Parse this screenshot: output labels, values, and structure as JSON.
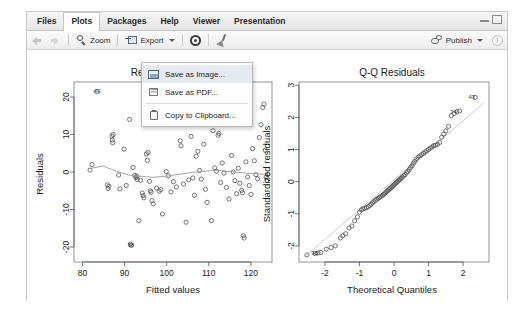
{
  "window": {
    "controls": [
      {
        "name": "minimize",
        "glyph": "—"
      },
      {
        "name": "maximize",
        "glyph": "□"
      }
    ]
  },
  "tabs": [
    {
      "label": "Files",
      "active": false
    },
    {
      "label": "Plots",
      "active": true
    },
    {
      "label": "Packages",
      "active": false
    },
    {
      "label": "Help",
      "active": false
    },
    {
      "label": "Viewer",
      "active": false
    },
    {
      "label": "Presentation",
      "active": false
    }
  ],
  "toolbar": {
    "back_icon": "back-arrow-icon",
    "forward_icon": "forward-arrow-icon",
    "zoom_label": "Zoom",
    "zoom_icon": "magnifier-icon",
    "export_label": "Export",
    "export_icon": "export-icon",
    "export_caret": "chevron-down-icon",
    "settings_icon": "gear-icon",
    "clear_icon": "broom-icon",
    "publish_label": "Publish",
    "publish_icon": "publish-icon",
    "publish_caret": "chevron-down-icon",
    "refresh_icon": "refresh-icon"
  },
  "export_menu": {
    "visible": true,
    "items": [
      {
        "label": "Save as Image...",
        "icon": "image-icon",
        "highlighted": true
      },
      {
        "label": "Save as PDF...",
        "icon": "pdf-icon",
        "highlighted": false
      },
      {
        "label": "Copy to Clipboard...",
        "icon": "clipboard-icon",
        "highlighted": false
      }
    ]
  },
  "colors": {
    "accent": "#e4eaf0",
    "panel_bg": "#f0f0f0",
    "plot_bg": "#ffffff",
    "point_stroke": "#4a4a4a",
    "line": "#9a9a9a"
  },
  "chart_data": [
    {
      "type": "scatter",
      "name": "residuals-vs-fitted",
      "title": "Residuals vs Fitted",
      "title_occluded": true,
      "xlabel": "Fitted values",
      "ylabel": "Residuals",
      "xlim": [
        78,
        125
      ],
      "ylim": [
        -24,
        24
      ],
      "xticks": [
        80,
        90,
        100,
        110,
        120
      ],
      "yticks": [
        -20,
        -10,
        0,
        10,
        20
      ],
      "grid": false,
      "legend": "none",
      "annotations": [
        {
          "label": "43",
          "x": 83.5,
          "y": 21.5
        },
        {
          "label": "74",
          "x": 110.0,
          "y": 17.3
        },
        {
          "label": "98",
          "x": 91.5,
          "y": -19.5
        }
      ],
      "smooth_line": {
        "name": "loess",
        "x": [
          81.5,
          85,
          88,
          91,
          94,
          97,
          100,
          103,
          106,
          109,
          112,
          115,
          118,
          121,
          124
        ],
        "y": [
          0.9,
          1.6,
          0.2,
          -0.8,
          -1.2,
          -1.4,
          -1.1,
          -0.6,
          -0.1,
          0.2,
          0.5,
          0.1,
          -0.2,
          -0.5,
          -0.6
        ]
      },
      "points": [
        {
          "x": 81.8,
          "y": 0.5
        },
        {
          "x": 82.3,
          "y": 2.0
        },
        {
          "x": 83.4,
          "y": 21.4
        },
        {
          "x": 85.9,
          "y": -3.4
        },
        {
          "x": 86.1,
          "y": -4.4
        },
        {
          "x": 86.3,
          "y": -3.8
        },
        {
          "x": 87.0,
          "y": 9.6
        },
        {
          "x": 87.1,
          "y": 8.5
        },
        {
          "x": 87.2,
          "y": 7.8
        },
        {
          "x": 87.3,
          "y": 10.0
        },
        {
          "x": 88.6,
          "y": -0.8
        },
        {
          "x": 88.9,
          "y": -4.5
        },
        {
          "x": 89.9,
          "y": 6.1
        },
        {
          "x": 90.4,
          "y": -3.6
        },
        {
          "x": 91.2,
          "y": 14.0
        },
        {
          "x": 91.4,
          "y": -19.2
        },
        {
          "x": 91.6,
          "y": -19.6
        },
        {
          "x": 92.0,
          "y": 1.2
        },
        {
          "x": 92.4,
          "y": -0.9
        },
        {
          "x": 92.7,
          "y": -1.5
        },
        {
          "x": 92.9,
          "y": -1.1
        },
        {
          "x": 93.0,
          "y": -2.0
        },
        {
          "x": 93.4,
          "y": -13.0
        },
        {
          "x": 93.8,
          "y": -2.2
        },
        {
          "x": 94.2,
          "y": -5.6
        },
        {
          "x": 94.4,
          "y": -6.3
        },
        {
          "x": 94.6,
          "y": -6.9
        },
        {
          "x": 95.2,
          "y": 4.8
        },
        {
          "x": 95.4,
          "y": 3.1
        },
        {
          "x": 95.6,
          "y": 5.2
        },
        {
          "x": 95.9,
          "y": -2.5
        },
        {
          "x": 96.1,
          "y": -5.0
        },
        {
          "x": 96.3,
          "y": -5.4
        },
        {
          "x": 96.5,
          "y": -7.6
        },
        {
          "x": 96.8,
          "y": -8.5
        },
        {
          "x": 97.6,
          "y": -4.3
        },
        {
          "x": 98.2,
          "y": -5.1
        },
        {
          "x": 98.6,
          "y": -4.7
        },
        {
          "x": 99.0,
          "y": -11.2
        },
        {
          "x": 99.6,
          "y": 17.0
        },
        {
          "x": 99.9,
          "y": 0.1
        },
        {
          "x": 100.4,
          "y": -1.0
        },
        {
          "x": 101.0,
          "y": -5.3
        },
        {
          "x": 101.6,
          "y": -2.6
        },
        {
          "x": 102.3,
          "y": -4.0
        },
        {
          "x": 103.2,
          "y": 8.3
        },
        {
          "x": 103.4,
          "y": 7.0
        },
        {
          "x": 104.0,
          "y": -3.2
        },
        {
          "x": 104.6,
          "y": -13.4
        },
        {
          "x": 105.2,
          "y": -2.1
        },
        {
          "x": 105.8,
          "y": 9.5
        },
        {
          "x": 106.2,
          "y": -1.6
        },
        {
          "x": 106.6,
          "y": -6.2
        },
        {
          "x": 107.0,
          "y": 4.2
        },
        {
          "x": 107.4,
          "y": 5.5
        },
        {
          "x": 107.8,
          "y": 0.4
        },
        {
          "x": 108.2,
          "y": -1.9
        },
        {
          "x": 108.8,
          "y": 7.4
        },
        {
          "x": 109.2,
          "y": -4.6
        },
        {
          "x": 109.6,
          "y": -8.1
        },
        {
          "x": 110.2,
          "y": 17.2
        },
        {
          "x": 110.6,
          "y": -13.0
        },
        {
          "x": 111.0,
          "y": 11.0
        },
        {
          "x": 111.4,
          "y": 1.1
        },
        {
          "x": 111.8,
          "y": 0.2
        },
        {
          "x": 112.2,
          "y": 9.8
        },
        {
          "x": 112.4,
          "y": 10.3
        },
        {
          "x": 112.8,
          "y": -2.8
        },
        {
          "x": 113.2,
          "y": 2.4
        },
        {
          "x": 113.6,
          "y": -0.3
        },
        {
          "x": 114.2,
          "y": -4.1
        },
        {
          "x": 114.8,
          "y": -7.2
        },
        {
          "x": 115.4,
          "y": 4.4
        },
        {
          "x": 115.8,
          "y": 0.0
        },
        {
          "x": 116.2,
          "y": -2.3
        },
        {
          "x": 116.6,
          "y": -5.8
        },
        {
          "x": 117.0,
          "y": 1.0
        },
        {
          "x": 117.4,
          "y": -3.0
        },
        {
          "x": 117.8,
          "y": -4.9
        },
        {
          "x": 118.0,
          "y": -5.5
        },
        {
          "x": 118.2,
          "y": -17.0
        },
        {
          "x": 118.4,
          "y": -17.6
        },
        {
          "x": 118.8,
          "y": 2.7
        },
        {
          "x": 119.2,
          "y": -1.3
        },
        {
          "x": 119.6,
          "y": -3.6
        },
        {
          "x": 120.0,
          "y": -6.0
        },
        {
          "x": 120.4,
          "y": 6.2
        },
        {
          "x": 120.8,
          "y": 3.0
        },
        {
          "x": 121.2,
          "y": -0.7
        },
        {
          "x": 121.6,
          "y": -1.8
        },
        {
          "x": 122.0,
          "y": 9.2
        },
        {
          "x": 122.4,
          "y": 12.6
        },
        {
          "x": 122.8,
          "y": 17.2
        },
        {
          "x": 123.1,
          "y": 18.1
        },
        {
          "x": 123.4,
          "y": 5.8
        },
        {
          "x": 123.6,
          "y": -1.4
        },
        {
          "x": 123.8,
          "y": -2.2
        },
        {
          "x": 124.0,
          "y": -0.6
        }
      ]
    },
    {
      "type": "scatter",
      "name": "qq-residuals",
      "title": "Q-Q Residuals",
      "xlabel": "Theoretical Quantiles",
      "ylabel": "Standardized residuals",
      "xlim": [
        -2.75,
        2.75
      ],
      "ylim": [
        -2.5,
        3.1
      ],
      "xticks": [
        -2,
        -1,
        0,
        1,
        2
      ],
      "yticks": [
        -2,
        -1,
        0,
        1,
        2,
        3
      ],
      "grid": false,
      "legend": "none",
      "reference_line": {
        "x0": -2.6,
        "y0": -2.35,
        "x1": 2.6,
        "y1": 2.45
      },
      "annotations": [
        {
          "label": "43",
          "x": 2.25,
          "y": 2.62
        },
        {
          "label": "74",
          "x": 1.72,
          "y": 2.18
        },
        {
          "label": "98",
          "x": -2.3,
          "y": -2.22
        }
      ],
      "points": [
        {
          "x": -2.52,
          "y": -2.28
        },
        {
          "x": -2.28,
          "y": -2.24
        },
        {
          "x": -2.2,
          "y": -2.22
        },
        {
          "x": -2.12,
          "y": -2.2
        },
        {
          "x": -1.96,
          "y": -2.1
        },
        {
          "x": -1.82,
          "y": -2.05
        },
        {
          "x": -1.7,
          "y": -2.0
        },
        {
          "x": -1.55,
          "y": -1.75
        },
        {
          "x": -1.48,
          "y": -1.68
        },
        {
          "x": -1.4,
          "y": -1.62
        },
        {
          "x": -1.3,
          "y": -1.44
        },
        {
          "x": -1.22,
          "y": -1.38
        },
        {
          "x": -1.14,
          "y": -1.22
        },
        {
          "x": -1.06,
          "y": -1.1
        },
        {
          "x": -1.0,
          "y": -0.95
        },
        {
          "x": -0.95,
          "y": -0.88
        },
        {
          "x": -0.9,
          "y": -0.85
        },
        {
          "x": -0.85,
          "y": -0.83
        },
        {
          "x": -0.8,
          "y": -0.81
        },
        {
          "x": -0.75,
          "y": -0.78
        },
        {
          "x": -0.7,
          "y": -0.74
        },
        {
          "x": -0.66,
          "y": -0.7
        },
        {
          "x": -0.62,
          "y": -0.66
        },
        {
          "x": -0.58,
          "y": -0.62
        },
        {
          "x": -0.54,
          "y": -0.58
        },
        {
          "x": -0.5,
          "y": -0.55
        },
        {
          "x": -0.46,
          "y": -0.52
        },
        {
          "x": -0.42,
          "y": -0.49
        },
        {
          "x": -0.38,
          "y": -0.46
        },
        {
          "x": -0.34,
          "y": -0.43
        },
        {
          "x": -0.3,
          "y": -0.4
        },
        {
          "x": -0.27,
          "y": -0.37
        },
        {
          "x": -0.24,
          "y": -0.34
        },
        {
          "x": -0.21,
          "y": -0.31
        },
        {
          "x": -0.18,
          "y": -0.28
        },
        {
          "x": -0.15,
          "y": -0.25
        },
        {
          "x": -0.12,
          "y": -0.22
        },
        {
          "x": -0.09,
          "y": -0.19
        },
        {
          "x": -0.06,
          "y": -0.16
        },
        {
          "x": -0.03,
          "y": -0.13
        },
        {
          "x": 0.0,
          "y": -0.1
        },
        {
          "x": 0.03,
          "y": -0.07
        },
        {
          "x": 0.06,
          "y": -0.04
        },
        {
          "x": 0.09,
          "y": -0.01
        },
        {
          "x": 0.12,
          "y": 0.02
        },
        {
          "x": 0.15,
          "y": 0.05
        },
        {
          "x": 0.18,
          "y": 0.08
        },
        {
          "x": 0.21,
          "y": 0.11
        },
        {
          "x": 0.24,
          "y": 0.14
        },
        {
          "x": 0.28,
          "y": 0.18
        },
        {
          "x": 0.32,
          "y": 0.22
        },
        {
          "x": 0.36,
          "y": 0.27
        },
        {
          "x": 0.4,
          "y": 0.32
        },
        {
          "x": 0.44,
          "y": 0.38
        },
        {
          "x": 0.48,
          "y": 0.44
        },
        {
          "x": 0.52,
          "y": 0.5
        },
        {
          "x": 0.56,
          "y": 0.57
        },
        {
          "x": 0.6,
          "y": 0.63
        },
        {
          "x": 0.65,
          "y": 0.7
        },
        {
          "x": 0.7,
          "y": 0.76
        },
        {
          "x": 0.75,
          "y": 0.8
        },
        {
          "x": 0.8,
          "y": 0.84
        },
        {
          "x": 0.85,
          "y": 0.88
        },
        {
          "x": 0.9,
          "y": 0.92
        },
        {
          "x": 0.95,
          "y": 0.96
        },
        {
          "x": 1.0,
          "y": 1.0
        },
        {
          "x": 1.05,
          "y": 1.04
        },
        {
          "x": 1.1,
          "y": 1.08
        },
        {
          "x": 1.15,
          "y": 1.12
        },
        {
          "x": 1.2,
          "y": 1.13
        },
        {
          "x": 1.26,
          "y": 1.16
        },
        {
          "x": 1.32,
          "y": 1.22
        },
        {
          "x": 1.38,
          "y": 1.38
        },
        {
          "x": 1.44,
          "y": 1.48
        },
        {
          "x": 1.5,
          "y": 1.58
        },
        {
          "x": 1.58,
          "y": 1.72
        },
        {
          "x": 1.66,
          "y": 2.05
        },
        {
          "x": 1.74,
          "y": 2.12
        },
        {
          "x": 1.82,
          "y": 2.18
        },
        {
          "x": 1.9,
          "y": 2.2
        },
        {
          "x": 2.35,
          "y": 2.62
        }
      ]
    }
  ]
}
